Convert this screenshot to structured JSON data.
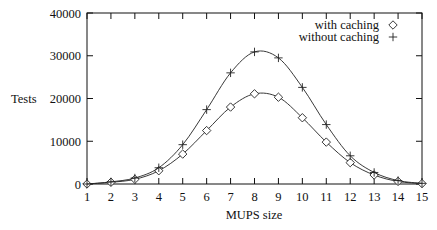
{
  "chart_data": {
    "type": "line",
    "title": "",
    "xlabel": "MUPS size",
    "ylabel": "Tests",
    "xlim": [
      1,
      15
    ],
    "ylim": [
      0,
      40000
    ],
    "x_ticks": [
      1,
      2,
      3,
      4,
      5,
      6,
      7,
      8,
      9,
      10,
      11,
      12,
      13,
      14,
      15
    ],
    "x_tick_labels": [
      "1",
      "2",
      "3",
      "4",
      "5",
      "6",
      "7",
      "8",
      "9",
      "10",
      "11",
      "12",
      "13",
      "14",
      "15"
    ],
    "y_ticks": [
      0,
      10000,
      20000,
      30000,
      40000
    ],
    "y_tick_labels": [
      "0",
      "10000",
      "20000",
      "30000",
      "40000"
    ],
    "grid": false,
    "legend_position": "top-right",
    "x": [
      1,
      2,
      3,
      4,
      5,
      6,
      7,
      8,
      9,
      10,
      11,
      12,
      13,
      14,
      15
    ],
    "series": [
      {
        "name": "with caching",
        "marker": "diamond",
        "values": [
          0,
          400,
          1100,
          3100,
          7000,
          12500,
          18000,
          21100,
          20300,
          15500,
          9800,
          5000,
          2100,
          600,
          100
        ]
      },
      {
        "name": "without caching",
        "marker": "plus",
        "values": [
          0,
          500,
          1400,
          3800,
          9200,
          17400,
          26000,
          30900,
          29500,
          22600,
          13900,
          6600,
          2700,
          800,
          150
        ]
      }
    ]
  },
  "layout": {
    "plot": {
      "left": 87,
      "right": 422,
      "top": 13,
      "bottom": 184
    }
  }
}
